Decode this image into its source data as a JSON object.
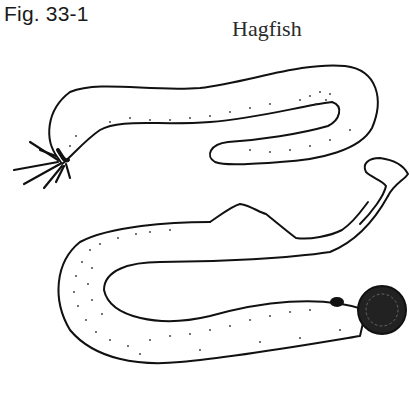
{
  "figure": {
    "label": "Fig. 33-1",
    "title": "Hagfish"
  },
  "illustration": {
    "subject": "hagfish",
    "style": "black ink line drawing with stippling",
    "parts": [
      "head-with-barbels",
      "body",
      "mouth-disc",
      "eye-spot",
      "fin-fold",
      "tail"
    ],
    "colors": {
      "ink": "#111111",
      "background": "#ffffff"
    }
  }
}
